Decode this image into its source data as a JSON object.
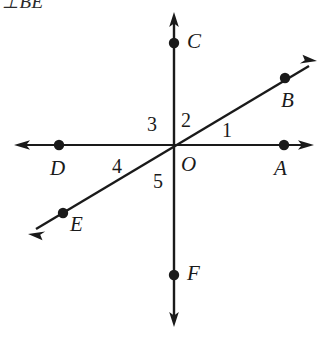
{
  "figure": {
    "width": 328,
    "height": 337,
    "background_color": "#ffffff",
    "stroke_color": "#1a1a1a",
    "header_text": "⊥BE",
    "origin": {
      "x": 175,
      "y": 144
    },
    "lines": [
      {
        "name": "vertical-line-CF",
        "from": {
          "x": 174,
          "y": 14
        },
        "to": {
          "x": 174,
          "y": 325
        },
        "arrow_start": true,
        "arrow_end": true
      },
      {
        "name": "horizontal-line-DA",
        "from": {
          "x": 16,
          "y": 145
        },
        "to": {
          "x": 312,
          "y": 145
        },
        "arrow_start": true,
        "arrow_end": true
      },
      {
        "name": "diagonal-line-EB",
        "from": {
          "x": 30,
          "y": 233
        },
        "to": {
          "x": 315,
          "y": 62
        },
        "arrow_start": true,
        "arrow_end": true
      }
    ],
    "points": [
      {
        "id": "A",
        "label": "A",
        "x": 284,
        "y": 145,
        "label_x": 274,
        "label_y": 158
      },
      {
        "id": "B",
        "label": "B",
        "x": 285,
        "y": 78,
        "label_x": 281,
        "label_y": 90
      },
      {
        "id": "C",
        "label": "C",
        "x": 174,
        "y": 43,
        "label_x": 187,
        "label_y": 31
      },
      {
        "id": "D",
        "label": "D",
        "x": 59,
        "y": 145,
        "label_x": 50,
        "label_y": 158
      },
      {
        "id": "E",
        "label": "E",
        "x": 63,
        "y": 213,
        "label_x": 70,
        "label_y": 214
      },
      {
        "id": "F",
        "label": "F",
        "x": 174,
        "y": 275,
        "label_x": 187,
        "label_y": 263
      },
      {
        "id": "O",
        "label": "O",
        "x": 175,
        "y": 144,
        "label_x": 181,
        "label_y": 154
      }
    ],
    "angle_labels": [
      {
        "id": "1",
        "label": "1",
        "label_x": 222,
        "label_y": 120
      },
      {
        "id": "2",
        "label": "2",
        "label_x": 181,
        "label_y": 110
      },
      {
        "id": "3",
        "label": "3",
        "label_x": 147,
        "label_y": 114
      },
      {
        "id": "4",
        "label": "4",
        "label_x": 112,
        "label_y": 156
      },
      {
        "id": "5",
        "label": "5",
        "label_x": 153,
        "label_y": 171
      }
    ]
  }
}
